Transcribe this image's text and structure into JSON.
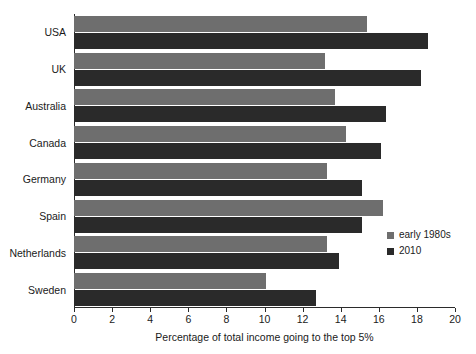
{
  "chart_data": {
    "type": "bar",
    "orientation": "horizontal",
    "title": "",
    "xlabel": "Percentage of total income going to the top 5%",
    "ylabel": "",
    "xlim": [
      0,
      20
    ],
    "xticks": [
      0,
      2,
      4,
      6,
      8,
      10,
      12,
      14,
      16,
      18,
      20
    ],
    "xtick_labels": [
      "0",
      "2",
      "4",
      "6",
      "8",
      "10",
      "12",
      "14",
      "16",
      "18",
      "20"
    ],
    "grid": false,
    "legend_position": "right-inside",
    "categories": [
      "USA",
      "UK",
      "Australia",
      "Canada",
      "Germany",
      "Spain",
      "Netherlands",
      "Sweden"
    ],
    "series": [
      {
        "name": "early 1980s",
        "color": "#6e6e6e",
        "values": [
          15.4,
          13.2,
          13.7,
          14.3,
          13.3,
          16.2,
          13.3,
          10.1
        ]
      },
      {
        "name": "2010",
        "color": "#2a2a2a",
        "values": [
          18.6,
          18.2,
          16.4,
          16.1,
          15.1,
          15.1,
          13.9,
          12.7
        ]
      }
    ]
  },
  "legend": {
    "entries": [
      {
        "label": "early 1980s",
        "swatch": "legend-swatch-gray"
      },
      {
        "label": "2010",
        "swatch": "legend-swatch-black"
      }
    ]
  }
}
